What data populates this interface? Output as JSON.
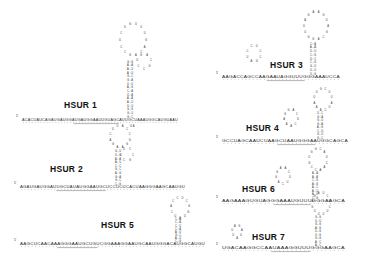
{
  "figure": {
    "kind": "rna-secondary-structure-panel",
    "background": "#ffffff",
    "ink": "#333333",
    "panel_count": 7
  },
  "structures": [
    {
      "id": "hsur1",
      "label": "HSUR 1",
      "label_x": 64,
      "label_y": 100,
      "five_prime_mark": "5'",
      "five_prime_x": 16,
      "five_prime_y": 117,
      "backbone_y": 121,
      "backbone_x0": 22,
      "backbone_x1": 178,
      "sequence": "ACACUAUCAGAUGAUGGAUGAUGGAAUUGUAGCAUUGCUAAAUGGCAUGUAAU",
      "underline_from": 0.33,
      "underline_to": 0.62,
      "stem_x": 130,
      "stem_bottom_y": 119,
      "stem_top_y": 60,
      "stem_pairs": 16,
      "loop_cx": 133,
      "loop_cy": 40,
      "loop_rx": 13,
      "loop_ry": 16,
      "loop_bases": 14,
      "bulge_cx": 144,
      "bulge_cy": 62,
      "bulge_rx": 7,
      "bulge_ry": 7,
      "bulge_bases": 7,
      "tail_text": "UA"
    },
    {
      "id": "hsur2",
      "label": "HSUR 2",
      "label_x": 50,
      "label_y": 164,
      "five_prime_mark": "5'",
      "five_prime_x": 14,
      "five_prime_y": 184,
      "backbone_y": 188,
      "backbone_x0": 20,
      "backbone_x1": 185,
      "sequence": "AGAUGAUGGAUUGCUAUAUGGAAUGCUCCUCUCACUAAGGGAAGCAAUGU",
      "underline_from": 0.22,
      "underline_to": 0.52,
      "stem_x": 118,
      "stem_bottom_y": 186,
      "stem_top_y": 150,
      "stem_pairs": 10,
      "loop_cx": 120,
      "loop_cy": 137,
      "loop_rx": 10,
      "loop_ry": 11,
      "loop_bases": 12,
      "bulge_cx": 127,
      "bulge_cy": 155,
      "bulge_rx": 6,
      "bulge_ry": 6,
      "bulge_bases": 6,
      "tail_text": ""
    },
    {
      "id": "hsur5",
      "label": "HSUR 5",
      "label_x": 101,
      "label_y": 220,
      "five_prime_mark": "5'",
      "five_prime_x": 14,
      "five_prime_y": 241,
      "backbone_y": 245,
      "backbone_x0": 20,
      "backbone_x1": 205,
      "sequence": "AAGCUCAACAAAGGGAAUGCUGUCGGAAAGGAAUGCAAUGGGACAUGGCAUGU",
      "underline_from": 0.2,
      "underline_to": 0.42,
      "stem_x": 178,
      "stem_bottom_y": 243,
      "stem_top_y": 218,
      "stem_pairs": 8,
      "loop_cx": 180,
      "loop_cy": 208,
      "loop_rx": 9,
      "loop_ry": 10,
      "loop_bases": 11,
      "bulge_cx": 0,
      "bulge_cy": 0,
      "bulge_rx": 0,
      "bulge_ry": 0,
      "bulge_bases": 0,
      "tail_text": ""
    },
    {
      "id": "hsur3",
      "label": "HSUR 3",
      "label_x": 270,
      "label_y": 60,
      "five_prime_mark": "5'",
      "five_prime_x": 216,
      "five_prime_y": 74,
      "backbone_y": 78,
      "backbone_x0": 222,
      "backbone_x1": 340,
      "sequence": "AAGACCAGCCAAGAAUAGGUUUGGGAAAUCCA",
      "underline_from": 0.38,
      "underline_to": 0.7,
      "stem_x": 313,
      "stem_bottom_y": 76,
      "stem_top_y": 42,
      "stem_pairs": 9,
      "loop_cx": 316,
      "loop_cy": 26,
      "loop_rx": 12,
      "loop_ry": 14,
      "loop_bases": 14,
      "bulge_cx": 254,
      "bulge_cy": 54,
      "bulge_rx": 7,
      "bulge_ry": 8,
      "bulge_bases": 8,
      "tail_text": ""
    },
    {
      "id": "hsur4",
      "label": "HSUR 4",
      "label_x": 246,
      "label_y": 123,
      "five_prime_mark": "5'",
      "five_prime_x": 216,
      "five_prime_y": 138,
      "backbone_y": 142,
      "backbone_x0": 222,
      "backbone_x1": 348,
      "sequence": "GCCUAGCAAUCUAAGCUAAUGGGAAUGGCAGCA",
      "underline_from": 0.44,
      "underline_to": 0.74,
      "stem_x": 320,
      "stem_bottom_y": 140,
      "stem_top_y": 112,
      "stem_pairs": 8,
      "loop_cx": 323,
      "loop_cy": 100,
      "loop_rx": 9,
      "loop_ry": 11,
      "loop_bases": 12,
      "bulge_cx": 291,
      "bulge_cy": 118,
      "bulge_rx": 7,
      "bulge_ry": 8,
      "bulge_bases": 9,
      "tail_text": ""
    },
    {
      "id": "hsur6",
      "label": "HSUR 6",
      "label_x": 242,
      "label_y": 184,
      "five_prime_mark": "5'",
      "five_prime_x": 216,
      "five_prime_y": 198,
      "backbone_y": 202,
      "backbone_x0": 222,
      "backbone_x1": 345,
      "sequence": "AAGAAAGUGUAGGGAAAUGUUUGGGAAGCA",
      "underline_from": 0.42,
      "underline_to": 0.72,
      "stem_x": 315,
      "stem_bottom_y": 200,
      "stem_top_y": 172,
      "stem_pairs": 8,
      "loop_cx": 318,
      "loop_cy": 160,
      "loop_rx": 9,
      "loop_ry": 11,
      "loop_bases": 12,
      "bulge_cx": 283,
      "bulge_cy": 176,
      "bulge_rx": 7,
      "bulge_ry": 8,
      "bulge_bases": 9,
      "tail_text": ""
    },
    {
      "id": "hsur7",
      "label": "HSUR 7",
      "label_x": 252,
      "label_y": 232,
      "five_prime_mark": "5'",
      "five_prime_x": 216,
      "five_prime_y": 245,
      "backbone_y": 249,
      "backbone_x0": 222,
      "backbone_x1": 345,
      "sequence": "UGACAAGGCCAAUAAAGGUUUGGGAAGCA",
      "underline_from": 0.4,
      "underline_to": 0.72,
      "stem_x": 318,
      "stem_bottom_y": 247,
      "stem_top_y": 216,
      "stem_pairs": 9,
      "loop_cx": 321,
      "loop_cy": 204,
      "loop_rx": 9,
      "loop_ry": 11,
      "loop_bases": 12,
      "bulge_cx": 237,
      "bulge_cy": 232,
      "bulge_rx": 5,
      "bulge_ry": 6,
      "bulge_bases": 7,
      "tail_text": ""
    }
  ],
  "nucleotide_alphabet": [
    "A",
    "C",
    "G",
    "U"
  ]
}
